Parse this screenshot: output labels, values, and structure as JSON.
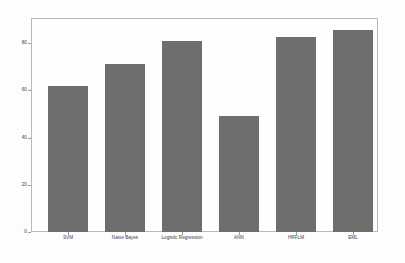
{
  "chart_data": {
    "type": "bar",
    "title": "",
    "subtitle": "",
    "xlabel": "",
    "ylabel": "",
    "categories": [
      "SVM",
      "Naive Bayes",
      "Logistic Regression",
      "ANN",
      "HRFLM",
      "EML"
    ],
    "values": [
      61.5,
      71.0,
      80.6,
      49.2,
      82.3,
      85.3
    ],
    "series": [
      {
        "name": "Accuracy",
        "values": [
          61.5,
          71.0,
          80.6,
          49.2,
          82.3,
          85.3
        ]
      }
    ],
    "ylim": [
      0,
      90
    ],
    "yticks": [
      0,
      20,
      40,
      60,
      80
    ],
    "ytick_labels": [
      "0",
      "20",
      "40",
      "60",
      "80"
    ],
    "grid": false,
    "legend": null,
    "legend_position": "none",
    "bar_color": "#6e6e6e",
    "frame_color": "#b9b9b9",
    "background_color": "#fdfdfd",
    "tick_color": "#9a9a9a",
    "annotations": []
  }
}
